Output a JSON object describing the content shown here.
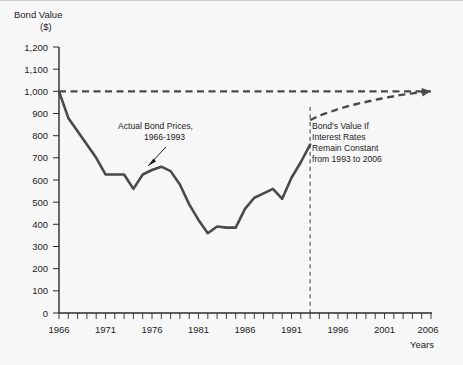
{
  "chart_data": {
    "type": "line",
    "title": "Bond Value ($)",
    "xlabel": "Years",
    "ylabel": "Bond Value ($)",
    "xlim": [
      1966,
      2006
    ],
    "ylim": [
      0,
      1200
    ],
    "ytick_step": 100,
    "xtick_step": 5,
    "xtick_minor_step": 1,
    "grid": false,
    "legend": "none",
    "y_tick_labels": [
      "1,200",
      "1,100",
      "1,000",
      "900",
      "800",
      "700",
      "600",
      "500",
      "400",
      "300",
      "200",
      "100",
      "0"
    ],
    "y_tick_values": [
      1200,
      1100,
      1000,
      900,
      800,
      700,
      600,
      500,
      400,
      300,
      200,
      100,
      0
    ],
    "x_tick_labels": [
      "1966",
      "1971",
      "1976",
      "1981",
      "1986",
      "1991",
      "1996",
      "2001",
      "2006"
    ],
    "x_tick_values": [
      1966,
      1971,
      1976,
      1981,
      1986,
      1991,
      1996,
      2001,
      2006
    ],
    "series": [
      {
        "name": "Actual Bond Prices, 1966-1993",
        "style": "solid",
        "color": "#4a4a4a",
        "x": [
          1966,
          1967,
          1968,
          1969,
          1970,
          1971,
          1972,
          1973,
          1974,
          1975,
          1976,
          1977,
          1978,
          1979,
          1980,
          1981,
          1982,
          1983,
          1984,
          1985,
          1986,
          1987,
          1988,
          1989,
          1990,
          1991,
          1992,
          1993
        ],
        "values": [
          1000,
          880,
          820,
          760,
          700,
          625,
          625,
          625,
          560,
          625,
          645,
          660,
          640,
          580,
          490,
          420,
          360,
          390,
          385,
          385,
          470,
          520,
          540,
          560,
          515,
          610,
          680,
          760
        ]
      },
      {
        "name": "Bond's Value If Interest Rates Remain Constant from 1993 to 2006",
        "style": "dashed",
        "color": "#4a4a4a",
        "x": [
          1993,
          1994,
          1995,
          1996,
          1997,
          1998,
          1999,
          2000,
          2001,
          2002,
          2003,
          2004,
          2005,
          2006
        ],
        "values": [
          870,
          890,
          905,
          920,
          932,
          943,
          952,
          962,
          970,
          978,
          985,
          991,
          996,
          1000
        ]
      },
      {
        "name": "Face value reference",
        "style": "dashed-reference",
        "color": "#4a4a4a",
        "x": [
          1966,
          2006
        ],
        "values": [
          1000,
          1000
        ]
      }
    ],
    "annotations": [
      {
        "name": "actual-prices-annotation",
        "lines": [
          "Actual Bond Prices,",
          "1966-1993"
        ],
        "points_to_year": 1979,
        "points_to_value": 640
      },
      {
        "name": "projection-annotation",
        "lines": [
          "Bond's Value If",
          "Interest Rates",
          "Remain Constant",
          "from 1993 to 2006"
        ]
      },
      {
        "name": "divider-year",
        "value": 1993
      }
    ]
  },
  "labels": {
    "y_axis_title_line1": "Bond Value",
    "y_axis_title_line2": "($)",
    "x_axis_title": "Years"
  }
}
